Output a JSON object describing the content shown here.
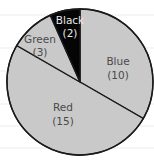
{
  "chart_data": {
    "type": "pie",
    "title": "",
    "total": 30,
    "start_angle_deg": 0,
    "direction": "clockwise",
    "slices": [
      {
        "name": "Blue",
        "label": "Blue",
        "value_label": "(10)",
        "value": 10,
        "fill": "#c9c9c9",
        "text_color": "dark"
      },
      {
        "name": "Red",
        "label": "Red",
        "value_label": "(15)",
        "value": 15,
        "fill": "#c9c9c9",
        "text_color": "dark"
      },
      {
        "name": "Green",
        "label": "Green",
        "value_label": "(3)",
        "value": 3,
        "fill": "#c9c9c9",
        "text_color": "dark"
      },
      {
        "name": "Black",
        "label": "Black",
        "value_label": "(2)",
        "value": 2,
        "fill": "#050505",
        "text_color": "light"
      }
    ],
    "categories": [
      "Blue",
      "Red",
      "Green",
      "Black"
    ],
    "values": [
      10,
      15,
      3,
      2
    ],
    "legend": "none (labels inside slices)"
  },
  "layout": {
    "cx": 80,
    "cy": 82,
    "r": 73,
    "paper_lines_y": [
      15,
      48,
      71,
      104,
      126,
      148
    ],
    "label_positions": [
      {
        "x": 118,
        "y1": 65,
        "y2": 79
      },
      {
        "x": 63,
        "y1": 111,
        "y2": 125
      },
      {
        "x": 40,
        "y1": 43,
        "y2": 56
      },
      {
        "x": 70,
        "y1": 24,
        "y2": 37
      }
    ]
  }
}
